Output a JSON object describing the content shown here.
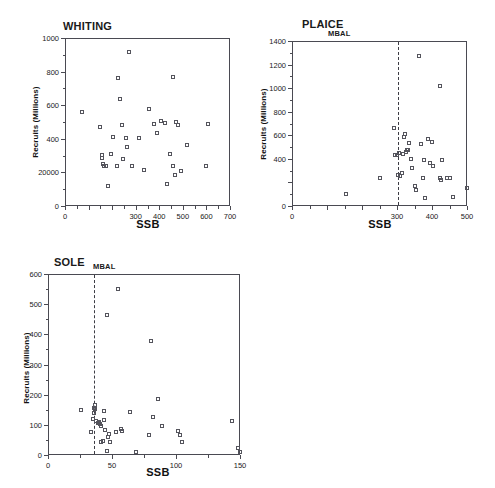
{
  "figure": {
    "panel_count": 3,
    "marker_style": "open-square",
    "axis_color": "#4a4a52",
    "marker_color": "#54545c",
    "background": "#ffffff"
  },
  "chart_data": [
    {
      "type": "scatter",
      "title": "WHITING",
      "xlabel": "SSB",
      "ylabel": "Recruits (Millions)",
      "xlim": [
        0,
        700
      ],
      "ylim": [
        0,
        1000
      ],
      "xticks": [
        0,
        100,
        200,
        300,
        400,
        500,
        600,
        700
      ],
      "xticklabels": [
        "0",
        "",
        "",
        "300",
        "400",
        "500",
        "600",
        "700"
      ],
      "yticks": [
        0,
        200,
        400,
        600,
        800,
        1000
      ],
      "yticklabels": [
        "0",
        "20000",
        "400",
        "600",
        "800",
        "1000"
      ],
      "grid": false,
      "legend": null,
      "mbal_line": null,
      "points": [
        [
          68,
          563
        ],
        [
          143,
          475
        ],
        [
          152,
          310
        ],
        [
          154,
          290
        ],
        [
          158,
          253
        ],
        [
          163,
          243
        ],
        [
          170,
          247
        ],
        [
          180,
          127
        ],
        [
          190,
          318
        ],
        [
          198,
          415
        ],
        [
          215,
          243
        ],
        [
          222,
          768
        ],
        [
          228,
          643
        ],
        [
          236,
          486
        ],
        [
          243,
          286
        ],
        [
          253,
          412
        ],
        [
          258,
          358
        ],
        [
          268,
          925
        ],
        [
          282,
          243
        ],
        [
          309,
          412
        ],
        [
          330,
          220
        ],
        [
          352,
          582
        ],
        [
          372,
          497
        ],
        [
          388,
          439
        ],
        [
          404,
          511
        ],
        [
          418,
          500
        ],
        [
          430,
          137
        ],
        [
          440,
          318
        ],
        [
          452,
          774
        ],
        [
          456,
          245
        ],
        [
          461,
          190
        ],
        [
          468,
          503
        ],
        [
          474,
          486
        ],
        [
          487,
          215
        ],
        [
          512,
          369
        ],
        [
          592,
          245
        ],
        [
          604,
          497
        ]
      ]
    },
    {
      "type": "scatter",
      "title": "PLAICE",
      "xlabel": "SSB",
      "ylabel": "Recruits (Millions)",
      "xlim": [
        0,
        500
      ],
      "ylim": [
        0,
        1400
      ],
      "xticks": [
        0,
        100,
        200,
        300,
        400,
        500
      ],
      "xticklabels": [
        "0",
        "",
        "",
        "300",
        "400",
        "500"
      ],
      "yticks": [
        0,
        200,
        400,
        600,
        800,
        1000,
        1200,
        1400
      ],
      "yticklabels": [
        "0",
        "",
        "400",
        "600",
        "800",
        "1000",
        "1200",
        "1400"
      ],
      "grid": false,
      "legend": null,
      "mbal_line": {
        "label": "MBAL",
        "x": 300
      },
      "points": [
        [
          152,
          113
        ],
        [
          248,
          243
        ],
        [
          288,
          668
        ],
        [
          290,
          445
        ],
        [
          296,
          438
        ],
        [
          300,
          273
        ],
        [
          303,
          455
        ],
        [
          307,
          262
        ],
        [
          310,
          290
        ],
        [
          313,
          448
        ],
        [
          318,
          598
        ],
        [
          321,
          621
        ],
        [
          324,
          466
        ],
        [
          326,
          487
        ],
        [
          328,
          480
        ],
        [
          331,
          543
        ],
        [
          338,
          410
        ],
        [
          341,
          330
        ],
        [
          348,
          177
        ],
        [
          352,
          147
        ],
        [
          360,
          1285
        ],
        [
          366,
          538
        ],
        [
          370,
          248
        ],
        [
          374,
          402
        ],
        [
          376,
          75
        ],
        [
          386,
          577
        ],
        [
          392,
          372
        ],
        [
          397,
          549
        ],
        [
          400,
          345
        ],
        [
          419,
          1023
        ],
        [
          421,
          242
        ],
        [
          424,
          232
        ],
        [
          427,
          399
        ],
        [
          440,
          243
        ],
        [
          448,
          248
        ],
        [
          458,
          85
        ],
        [
          497,
          163
        ]
      ]
    },
    {
      "type": "scatter",
      "title": "SOLE",
      "xlabel": "SSB",
      "ylabel": "Recruits (Millions)",
      "xlim": [
        0,
        150
      ],
      "ylim": [
        0,
        600
      ],
      "xticks": [
        0,
        50,
        100,
        150
      ],
      "xticklabels": [
        "0",
        "50",
        "100",
        "150"
      ],
      "yticks": [
        0,
        100,
        200,
        300,
        400,
        500,
        600
      ],
      "yticklabels": [
        "0",
        "100",
        "200",
        "300",
        "400",
        "500",
        "600"
      ],
      "grid": false,
      "legend": null,
      "mbal_line": {
        "label": "MBAL",
        "x": 35
      },
      "points": [
        [
          25,
          152
        ],
        [
          33,
          78
        ],
        [
          34,
          123
        ],
        [
          35,
          160
        ],
        [
          35,
          143
        ],
        [
          36,
          168
        ],
        [
          36,
          155
        ],
        [
          37,
          115
        ],
        [
          38,
          108
        ],
        [
          39,
          112
        ],
        [
          40,
          106
        ],
        [
          41,
          98
        ],
        [
          41,
          47
        ],
        [
          42,
          50
        ],
        [
          43,
          148
        ],
        [
          43,
          120
        ],
        [
          44,
          85
        ],
        [
          45,
          15
        ],
        [
          45,
          467
        ],
        [
          46,
          62
        ],
        [
          47,
          73
        ],
        [
          48,
          48
        ],
        [
          52,
          80
        ],
        [
          54,
          553
        ],
        [
          56,
          88
        ],
        [
          57,
          84
        ],
        [
          63,
          145
        ],
        [
          68,
          12
        ],
        [
          78,
          68
        ],
        [
          80,
          382
        ],
        [
          81,
          130
        ],
        [
          85,
          190
        ],
        [
          88,
          98
        ],
        [
          101,
          82
        ],
        [
          102,
          70
        ],
        [
          104,
          47
        ],
        [
          143,
          117
        ],
        [
          148,
          28
        ],
        [
          149,
          12
        ]
      ]
    }
  ]
}
